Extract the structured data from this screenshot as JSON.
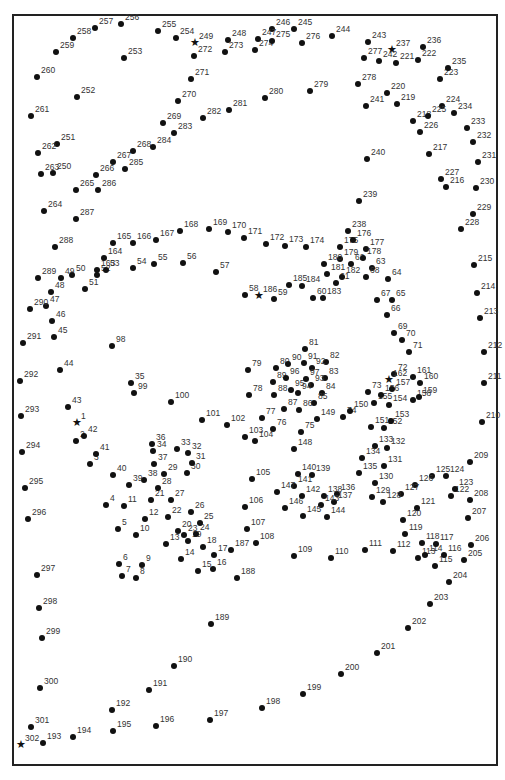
{
  "puzzle": {
    "type": "dot-to-dot",
    "stars": [
      1,
      162,
      186,
      237,
      249,
      302
    ],
    "points": [
      [
        1,
        77,
        423
      ],
      [
        2,
        76,
        441
      ],
      [
        3,
        90,
        464
      ],
      [
        4,
        106,
        505
      ],
      [
        5,
        118,
        529
      ],
      [
        6,
        119,
        564
      ],
      [
        7,
        122,
        576
      ],
      [
        8,
        136,
        578
      ],
      [
        9,
        142,
        565
      ],
      [
        10,
        136,
        535
      ],
      [
        11,
        124,
        506
      ],
      [
        12,
        145,
        519
      ],
      [
        13,
        166,
        544
      ],
      [
        14,
        181,
        559
      ],
      [
        15,
        198,
        571
      ],
      [
        16,
        213,
        569
      ],
      [
        17,
        214,
        555
      ],
      [
        18,
        203,
        547
      ],
      [
        19,
        188,
        541
      ],
      [
        20,
        178,
        531
      ],
      [
        21,
        151,
        500
      ],
      [
        22,
        168,
        517
      ],
      [
        23,
        184,
        535
      ],
      [
        24,
        196,
        534
      ],
      [
        25,
        200,
        523
      ],
      [
        26,
        191,
        512
      ],
      [
        27,
        171,
        500
      ],
      [
        28,
        158,
        488
      ],
      [
        29,
        164,
        474
      ],
      [
        30,
        187,
        473
      ],
      [
        31,
        192,
        463
      ],
      [
        32,
        188,
        453
      ],
      [
        33,
        177,
        449
      ],
      [
        34,
        153,
        451
      ],
      [
        35,
        131,
        383
      ],
      [
        36,
        152,
        444
      ],
      [
        37,
        154,
        464
      ],
      [
        38,
        144,
        480
      ],
      [
        39,
        129,
        485
      ],
      [
        40,
        113,
        475
      ],
      [
        41,
        96,
        454
      ],
      [
        42,
        84,
        436
      ],
      [
        43,
        68,
        407
      ],
      [
        44,
        60,
        370
      ],
      [
        45,
        54,
        337
      ],
      [
        46,
        52,
        321
      ],
      [
        47,
        46,
        306
      ],
      [
        48,
        51,
        292
      ],
      [
        49,
        61,
        278
      ],
      [
        50,
        72,
        275
      ],
      [
        51,
        85,
        289
      ],
      [
        52,
        97,
        275
      ],
      [
        53,
        106,
        270
      ],
      [
        54,
        133,
        268
      ],
      [
        55,
        154,
        264
      ],
      [
        56,
        183,
        263
      ],
      [
        57,
        216,
        272
      ],
      [
        58,
        245,
        295
      ],
      [
        59,
        274,
        299
      ],
      [
        60,
        313,
        298
      ],
      [
        61,
        336,
        283
      ],
      [
        62,
        351,
        264
      ],
      [
        63,
        372,
        268
      ],
      [
        64,
        388,
        279
      ],
      [
        65,
        392,
        300
      ],
      [
        66,
        387,
        315
      ],
      [
        67,
        377,
        300
      ],
      [
        68,
        366,
        277
      ],
      [
        69,
        394,
        333
      ],
      [
        70,
        402,
        340
      ],
      [
        71,
        409,
        352
      ],
      [
        72,
        394,
        374
      ],
      [
        73,
        368,
        392
      ],
      [
        74,
        343,
        417
      ],
      [
        75,
        301,
        432
      ],
      [
        76,
        273,
        429
      ],
      [
        77,
        262,
        418
      ],
      [
        78,
        249,
        395
      ],
      [
        79,
        248,
        370
      ],
      [
        80,
        276,
        368
      ],
      [
        81,
        305,
        349
      ],
      [
        82,
        326,
        362
      ],
      [
        83,
        325,
        378
      ],
      [
        84,
        322,
        393
      ],
      [
        85,
        314,
        403
      ],
      [
        86,
        299,
        410
      ],
      [
        87,
        284,
        409
      ],
      [
        88,
        274,
        395
      ],
      [
        89,
        273,
        382
      ],
      [
        90,
        288,
        364
      ],
      [
        91,
        304,
        363
      ],
      [
        92,
        312,
        368
      ],
      [
        93,
        311,
        385
      ],
      [
        94,
        298,
        393
      ],
      [
        95,
        291,
        390
      ],
      [
        96,
        286,
        378
      ],
      [
        97,
        306,
        379
      ],
      [
        98,
        112,
        346
      ],
      [
        99,
        134,
        393
      ],
      [
        100,
        171,
        402
      ],
      [
        101,
        202,
        420
      ],
      [
        102,
        227,
        425
      ],
      [
        103,
        245,
        437
      ],
      [
        104,
        255,
        441
      ],
      [
        105,
        252,
        479
      ],
      [
        106,
        245,
        507
      ],
      [
        107,
        247,
        529
      ],
      [
        108,
        256,
        543
      ],
      [
        109,
        294,
        556
      ],
      [
        110,
        331,
        558
      ],
      [
        111,
        365,
        550
      ],
      [
        112,
        393,
        551
      ],
      [
        113,
        418,
        558
      ],
      [
        114,
        425,
        555
      ],
      [
        115,
        435,
        566
      ],
      [
        116,
        444,
        555
      ],
      [
        117,
        436,
        544
      ],
      [
        118,
        422,
        543
      ],
      [
        119,
        405,
        534
      ],
      [
        120,
        403,
        520
      ],
      [
        121,
        417,
        508
      ],
      [
        122,
        451,
        496
      ],
      [
        123,
        455,
        489
      ],
      [
        124,
        446,
        476
      ],
      [
        125,
        432,
        476
      ],
      [
        126,
        415,
        485
      ],
      [
        127,
        401,
        494
      ],
      [
        128,
        383,
        502
      ],
      [
        129,
        372,
        497
      ],
      [
        130,
        375,
        483
      ],
      [
        131,
        384,
        466
      ],
      [
        132,
        387,
        448
      ],
      [
        133,
        375,
        446
      ],
      [
        134,
        362,
        458
      ],
      [
        135,
        359,
        473
      ],
      [
        136,
        337,
        494
      ],
      [
        137,
        334,
        502
      ],
      [
        138,
        324,
        496
      ],
      [
        139,
        312,
        475
      ],
      [
        140,
        298,
        474
      ],
      [
        141,
        294,
        486
      ],
      [
        142,
        302,
        496
      ],
      [
        143,
        321,
        505
      ],
      [
        144,
        327,
        517
      ],
      [
        145,
        303,
        516
      ],
      [
        146,
        285,
        508
      ],
      [
        147,
        277,
        492
      ],
      [
        148,
        294,
        449
      ],
      [
        149,
        317,
        419
      ],
      [
        150,
        350,
        411
      ],
      [
        151,
        371,
        427
      ],
      [
        152,
        384,
        428
      ],
      [
        153,
        391,
        421
      ],
      [
        154,
        389,
        405
      ],
      [
        155,
        374,
        403
      ],
      [
        156,
        381,
        395
      ],
      [
        157,
        392,
        389
      ],
      [
        158,
        413,
        400
      ],
      [
        159,
        419,
        397
      ],
      [
        160,
        420,
        383
      ],
      [
        161,
        413,
        377
      ],
      [
        162,
        389,
        380
      ],
      [
        163,
        97,
        270
      ],
      [
        164,
        104,
        258
      ],
      [
        165,
        113,
        243
      ],
      [
        166,
        133,
        243
      ],
      [
        167,
        156,
        240
      ],
      [
        168,
        180,
        231
      ],
      [
        169,
        209,
        229
      ],
      [
        170,
        228,
        232
      ],
      [
        171,
        244,
        238
      ],
      [
        172,
        266,
        244
      ],
      [
        173,
        285,
        246
      ],
      [
        174,
        306,
        247
      ],
      [
        175,
        340,
        247
      ],
      [
        176,
        353,
        240
      ],
      [
        177,
        366,
        249
      ],
      [
        178,
        363,
        258
      ],
      [
        179,
        340,
        259
      ],
      [
        180,
        324,
        264
      ],
      [
        181,
        327,
        274
      ],
      [
        182,
        342,
        277
      ],
      [
        183,
        323,
        298
      ],
      [
        184,
        302,
        286
      ],
      [
        185,
        289,
        285
      ],
      [
        186,
        259,
        296
      ],
      [
        187,
        231,
        550
      ],
      [
        188,
        237,
        578
      ],
      [
        189,
        211,
        624
      ],
      [
        190,
        174,
        666
      ],
      [
        191,
        149,
        690
      ],
      [
        192,
        112,
        710
      ],
      [
        193,
        43,
        743
      ],
      [
        194,
        73,
        737
      ],
      [
        195,
        113,
        731
      ],
      [
        196,
        156,
        726
      ],
      [
        197,
        210,
        720
      ],
      [
        198,
        262,
        708
      ],
      [
        199,
        303,
        694
      ],
      [
        200,
        341,
        674
      ],
      [
        201,
        377,
        653
      ],
      [
        202,
        408,
        628
      ],
      [
        203,
        430,
        604
      ],
      [
        204,
        449,
        582
      ],
      [
        205,
        464,
        560
      ],
      [
        206,
        471,
        545
      ],
      [
        207,
        468,
        518
      ],
      [
        208,
        470,
        500
      ],
      [
        209,
        470,
        462
      ],
      [
        210,
        482,
        422
      ],
      [
        211,
        484,
        383
      ],
      [
        212,
        484,
        352
      ],
      [
        213,
        480,
        318
      ],
      [
        214,
        477,
        293
      ],
      [
        215,
        474,
        265
      ],
      [
        216,
        446,
        187
      ],
      [
        217,
        429,
        154
      ],
      [
        218,
        413,
        121
      ],
      [
        219,
        397,
        104
      ],
      [
        220,
        387,
        93
      ],
      [
        221,
        396,
        63
      ],
      [
        222,
        418,
        60
      ],
      [
        223,
        440,
        79
      ],
      [
        224,
        442,
        106
      ],
      [
        225,
        428,
        116
      ],
      [
        226,
        420,
        132
      ],
      [
        227,
        441,
        179
      ],
      [
        228,
        461,
        229
      ],
      [
        229,
        473,
        214
      ],
      [
        230,
        476,
        188
      ],
      [
        231,
        478,
        162
      ],
      [
        232,
        473,
        142
      ],
      [
        233,
        467,
        128
      ],
      [
        234,
        454,
        113
      ],
      [
        235,
        448,
        68
      ],
      [
        236,
        423,
        47
      ],
      [
        237,
        392,
        50
      ],
      [
        238,
        348,
        231
      ],
      [
        239,
        359,
        201
      ],
      [
        240,
        367,
        159
      ],
      [
        241,
        366,
        106
      ],
      [
        242,
        379,
        61
      ],
      [
        243,
        368,
        42
      ],
      [
        244,
        332,
        36
      ],
      [
        245,
        294,
        29
      ],
      [
        246,
        272,
        29
      ],
      [
        247,
        258,
        39
      ],
      [
        248,
        228,
        40
      ],
      [
        249,
        195,
        43
      ],
      [
        250,
        53,
        173
      ],
      [
        251,
        57,
        144
      ],
      [
        252,
        77,
        97
      ],
      [
        253,
        124,
        58
      ],
      [
        254,
        176,
        38
      ],
      [
        255,
        158,
        31
      ],
      [
        256,
        121,
        24
      ],
      [
        257,
        95,
        28
      ],
      [
        258,
        73,
        38
      ],
      [
        259,
        56,
        52
      ],
      [
        260,
        37,
        77
      ],
      [
        261,
        31,
        116
      ],
      [
        262,
        38,
        153
      ],
      [
        263,
        41,
        174
      ],
      [
        264,
        44,
        211
      ],
      [
        265,
        76,
        190
      ],
      [
        266,
        96,
        175
      ],
      [
        267,
        113,
        162
      ],
      [
        268,
        133,
        151
      ],
      [
        269,
        163,
        123
      ],
      [
        270,
        178,
        101
      ],
      [
        271,
        191,
        79
      ],
      [
        272,
        194,
        56
      ],
      [
        273,
        225,
        52
      ],
      [
        274,
        255,
        50
      ],
      [
        275,
        272,
        41
      ],
      [
        276,
        302,
        43
      ],
      [
        277,
        364,
        58
      ],
      [
        278,
        358,
        84
      ],
      [
        279,
        310,
        91
      ],
      [
        280,
        265,
        98
      ],
      [
        281,
        229,
        110
      ],
      [
        282,
        203,
        118
      ],
      [
        283,
        174,
        133
      ],
      [
        284,
        153,
        147
      ],
      [
        285,
        125,
        169
      ],
      [
        286,
        98,
        190
      ],
      [
        287,
        76,
        219
      ],
      [
        288,
        55,
        247
      ],
      [
        289,
        38,
        278
      ],
      [
        290,
        30,
        309
      ],
      [
        291,
        23,
        343
      ],
      [
        292,
        20,
        381
      ],
      [
        293,
        21,
        416
      ],
      [
        294,
        22,
        452
      ],
      [
        295,
        25,
        488
      ],
      [
        296,
        28,
        519
      ],
      [
        297,
        37,
        575
      ],
      [
        298,
        39,
        608
      ],
      [
        299,
        42,
        638
      ],
      [
        300,
        40,
        688
      ],
      [
        301,
        31,
        727
      ],
      [
        302,
        21,
        745
      ]
    ]
  }
}
